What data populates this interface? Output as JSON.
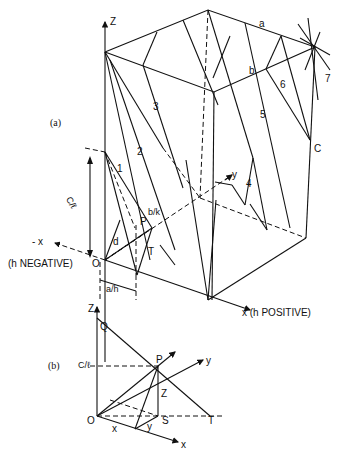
{
  "figure": {
    "panel_a": {
      "label": "(a)",
      "axes": {
        "z": "Z",
        "neg_x": "- x",
        "neg_x_note": "(h NEGATIVE)",
        "pos_x": "x (h POSITIVE)",
        "y": "y",
        "origin": "O"
      },
      "plane_numbers": [
        "1",
        "2",
        "3",
        "4",
        "5",
        "6",
        "7"
      ],
      "points": {
        "a": "a",
        "b": "b",
        "c": "C",
        "p": "P",
        "t": "T",
        "d": "d"
      },
      "intercepts": {
        "c_over_l": "C/ℓ",
        "a_over_h": "a/h",
        "b_over_k": "b/k"
      }
    },
    "panel_b": {
      "label": "(b)",
      "axes": {
        "z": "Z",
        "x": "x",
        "y": "y",
        "origin": "O"
      },
      "points": {
        "q": "Q",
        "p": "P",
        "s": "S",
        "t": "T"
      },
      "segments": {
        "x": "x",
        "y": "y",
        "z": "Z"
      },
      "intercept": "C/ℓ"
    }
  }
}
